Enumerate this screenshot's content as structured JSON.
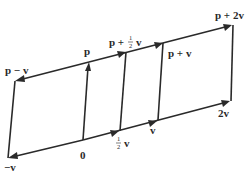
{
  "diagram": {
    "title": "",
    "points": {
      "origin": {
        "label": "0",
        "x": 83,
        "y": 140
      },
      "neg_v": {
        "label": "−v",
        "x": 8,
        "y": 158
      },
      "half_v": {
        "label_num": "1",
        "label_den": "2",
        "label_var": "v",
        "x": 120,
        "y": 131
      },
      "v": {
        "label": "v",
        "x": 158,
        "y": 120
      },
      "two_v": {
        "label": "2v",
        "x": 231,
        "y": 101
      },
      "p": {
        "label": "p",
        "x": 89,
        "y": 62
      },
      "p_minus_v": {
        "label": "p − v",
        "x": 15,
        "y": 81
      },
      "p_plus_half_v": {
        "label_pre": "p + ",
        "label_num": "1",
        "label_den": "2",
        "label_var": "v",
        "x": 126,
        "y": 52
      },
      "p_plus_v": {
        "label": "p + v",
        "x": 163,
        "y": 42
      },
      "p_plus_2v": {
        "label": "p + 2v",
        "x": 233,
        "y": 25
      }
    },
    "colors": {
      "stroke": "#2a2a2a",
      "background": "#ffffff"
    }
  }
}
